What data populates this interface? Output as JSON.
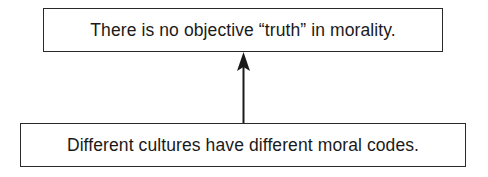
{
  "diagram": {
    "type": "argument-map",
    "nodes": [
      {
        "id": "conclusion",
        "text": "There is no objective “truth” in morality."
      },
      {
        "id": "premise",
        "text": "Different cultures have different moral codes."
      }
    ],
    "edges": [
      {
        "from": "premise",
        "to": "conclusion",
        "style": "solid-arrow"
      }
    ],
    "colors": {
      "border": "#2a2a2a",
      "text": "#1a1a1a",
      "background": "#ffffff"
    }
  }
}
